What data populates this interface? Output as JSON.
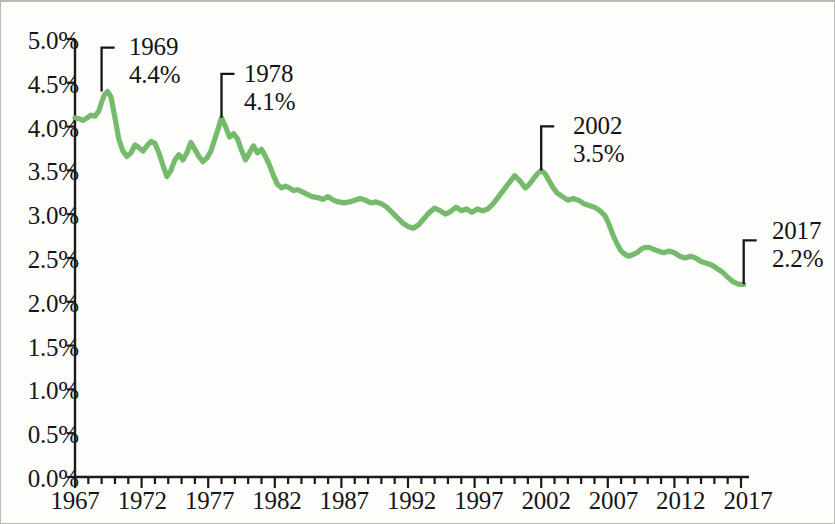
{
  "chart_data": {
    "type": "line",
    "title": "",
    "subtitle": "",
    "xlabel": "",
    "ylabel": "",
    "xlim": [
      1967,
      2017.6
    ],
    "ylim": [
      0.0,
      5.0
    ],
    "grid": false,
    "legend_position": "none",
    "line_color": "#76bb6b",
    "axis_color": "#1a1a1a",
    "y_tick_labels": [
      "0.0%",
      "0.5%",
      "1.0%",
      "1.5%",
      "2.0%",
      "2.5%",
      "3.0%",
      "3.5%",
      "4.0%",
      "4.5%",
      "5.0%"
    ],
    "y_tick_values": [
      0.0,
      0.5,
      1.0,
      1.5,
      2.0,
      2.5,
      3.0,
      3.5,
      4.0,
      4.5,
      5.0
    ],
    "x_tick_labels": [
      "1967",
      "1972",
      "1977",
      "1982",
      "1987",
      "1992",
      "1997",
      "2002",
      "2007",
      "2012",
      "2017"
    ],
    "x_tick_values": [
      1967,
      1972,
      1977,
      1982,
      1987,
      1992,
      1997,
      2002,
      2007,
      2012,
      2017
    ],
    "x_minor_tick_interval": 1,
    "annotations": [
      {
        "year": "1969",
        "value": "4.4%",
        "x": 1969.0,
        "y": 4.4
      },
      {
        "year": "1978",
        "value": "4.1%",
        "x": 1978.0,
        "y": 4.1
      },
      {
        "year": "2002",
        "value": "3.5%",
        "x": 2002.0,
        "y": 3.5
      },
      {
        "year": "2017",
        "value": "2.2%",
        "x": 2017.2,
        "y": 2.2
      }
    ],
    "series": [
      {
        "name": "rate",
        "x": [
          1967.0,
          1967.3,
          1967.6,
          1967.9,
          1968.2,
          1968.5,
          1968.8,
          1969.0,
          1969.2,
          1969.45,
          1969.7,
          1970.0,
          1970.3,
          1970.6,
          1970.9,
          1971.2,
          1971.5,
          1971.8,
          1972.1,
          1972.4,
          1972.7,
          1973.0,
          1973.3,
          1973.6,
          1973.9,
          1974.2,
          1974.5,
          1974.8,
          1975.1,
          1975.4,
          1975.7,
          1976.0,
          1976.3,
          1976.6,
          1976.9,
          1977.2,
          1977.5,
          1977.8,
          1978.0,
          1978.3,
          1978.6,
          1978.9,
          1979.2,
          1979.5,
          1979.8,
          1980.1,
          1980.4,
          1980.7,
          1981.0,
          1981.3,
          1981.6,
          1981.9,
          1982.2,
          1982.5,
          1982.8,
          1983.1,
          1983.4,
          1983.7,
          1984.0,
          1984.4,
          1984.8,
          1985.2,
          1985.6,
          1986.0,
          1986.4,
          1986.8,
          1987.2,
          1987.6,
          1988.0,
          1988.4,
          1988.8,
          1989.2,
          1989.6,
          1990.0,
          1990.4,
          1990.8,
          1991.2,
          1991.6,
          1992.0,
          1992.4,
          1992.8,
          1993.2,
          1993.6,
          1994.0,
          1994.4,
          1994.8,
          1995.2,
          1995.6,
          1996.0,
          1996.4,
          1996.8,
          1997.2,
          1997.6,
          1998.0,
          1998.4,
          1998.8,
          1999.2,
          1999.6,
          2000.0,
          2000.4,
          2000.8,
          2001.1,
          2001.4,
          2001.7,
          2002.0,
          2002.3,
          2002.6,
          2002.9,
          2003.2,
          2003.6,
          2004.0,
          2004.4,
          2004.8,
          2005.2,
          2005.6,
          2006.0,
          2006.4,
          2006.8,
          2007.1,
          2007.4,
          2007.7,
          2008.0,
          2008.3,
          2008.6,
          2008.9,
          2009.2,
          2009.5,
          2009.8,
          2010.1,
          2010.4,
          2010.8,
          2011.2,
          2011.6,
          2012.0,
          2012.4,
          2012.8,
          2013.2,
          2013.6,
          2014.0,
          2014.4,
          2014.8,
          2015.2,
          2015.6,
          2016.0,
          2016.4,
          2016.8,
          2017.0,
          2017.2
        ],
        "values": [
          4.1,
          4.09,
          4.07,
          4.1,
          4.13,
          4.12,
          4.18,
          4.28,
          4.36,
          4.4,
          4.34,
          4.1,
          3.85,
          3.72,
          3.66,
          3.7,
          3.79,
          3.76,
          3.72,
          3.78,
          3.83,
          3.81,
          3.7,
          3.56,
          3.43,
          3.5,
          3.62,
          3.68,
          3.62,
          3.7,
          3.82,
          3.74,
          3.66,
          3.6,
          3.64,
          3.72,
          3.86,
          4.0,
          4.1,
          4.0,
          3.88,
          3.92,
          3.86,
          3.73,
          3.62,
          3.7,
          3.78,
          3.7,
          3.74,
          3.66,
          3.56,
          3.44,
          3.34,
          3.3,
          3.32,
          3.3,
          3.27,
          3.28,
          3.26,
          3.23,
          3.2,
          3.19,
          3.17,
          3.2,
          3.16,
          3.14,
          3.13,
          3.14,
          3.16,
          3.18,
          3.16,
          3.13,
          3.14,
          3.12,
          3.08,
          3.02,
          2.96,
          2.9,
          2.86,
          2.84,
          2.88,
          2.95,
          3.02,
          3.07,
          3.04,
          3.0,
          3.03,
          3.08,
          3.04,
          3.06,
          3.02,
          3.06,
          3.04,
          3.06,
          3.12,
          3.2,
          3.28,
          3.36,
          3.44,
          3.38,
          3.3,
          3.34,
          3.4,
          3.46,
          3.5,
          3.46,
          3.38,
          3.3,
          3.24,
          3.2,
          3.16,
          3.18,
          3.16,
          3.12,
          3.1,
          3.08,
          3.04,
          2.98,
          2.88,
          2.76,
          2.66,
          2.58,
          2.54,
          2.52,
          2.54,
          2.56,
          2.6,
          2.62,
          2.62,
          2.6,
          2.58,
          2.56,
          2.58,
          2.56,
          2.52,
          2.5,
          2.52,
          2.5,
          2.46,
          2.44,
          2.42,
          2.38,
          2.34,
          2.28,
          2.23,
          2.2,
          2.2,
          2.2
        ]
      }
    ]
  },
  "axes": {
    "y_labels": [
      "5.0%",
      "4.5%",
      "4.0%",
      "3.5%",
      "3.0%",
      "2.5%",
      "2.0%",
      "1.5%",
      "1.0%",
      "0.5%",
      "0.0%"
    ],
    "x_labels": [
      "1967",
      "1972",
      "1977",
      "1982",
      "1987",
      "1992",
      "1997",
      "2002",
      "2007",
      "2012",
      "2017"
    ]
  },
  "annotation_text": {
    "a0_year": "1969",
    "a0_value": "4.4%",
    "a1_year": "1978",
    "a1_value": "4.1%",
    "a2_year": "2002",
    "a2_value": "3.5%",
    "a3_year": "2017",
    "a3_value": "2.2%"
  }
}
